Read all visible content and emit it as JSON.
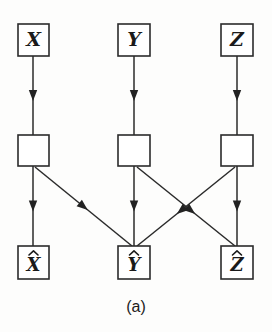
{
  "figure": {
    "caption": "(a)",
    "caption_x": 136,
    "caption_y": 308,
    "background_color": "#fdfdfc",
    "stroke_color": "#2b2b2b",
    "fill_color": "#ffffff",
    "width": 272,
    "height": 332
  },
  "diagram_data": {
    "type": "diagram",
    "description": "Three-layer signal flow graph: source nodes X, Y, Z feed into unlabeled processing blocks, which feed into reconstructed outputs X-hat, Y-hat, Z-hat with cross connections.",
    "columns": [
      {
        "id": "col-x",
        "center_x": 33
      },
      {
        "id": "col-y",
        "center_x": 134
      },
      {
        "id": "col-z",
        "center_x": 237
      }
    ],
    "rows": [
      {
        "id": "row-source",
        "top": 24,
        "label": "source"
      },
      {
        "id": "row-block",
        "top": 135,
        "label": "processing-block"
      },
      {
        "id": "row-output",
        "top": 246,
        "label": "output"
      }
    ],
    "nodes": [
      {
        "id": "node-x",
        "label": "X",
        "hat": false,
        "x": 18,
        "y": 24,
        "w": 31,
        "h": 32,
        "row": "source"
      },
      {
        "id": "node-y",
        "label": "Y",
        "hat": false,
        "x": 118,
        "y": 24,
        "w": 32,
        "h": 32,
        "row": "source"
      },
      {
        "id": "node-z",
        "label": "Z",
        "hat": false,
        "x": 221,
        "y": 24,
        "w": 32,
        "h": 32,
        "row": "source"
      },
      {
        "id": "block-x",
        "label": "",
        "hat": false,
        "x": 18,
        "y": 135,
        "w": 31,
        "h": 31,
        "row": "block"
      },
      {
        "id": "block-y",
        "label": "",
        "hat": false,
        "x": 118,
        "y": 135,
        "w": 32,
        "h": 31,
        "row": "block"
      },
      {
        "id": "block-z",
        "label": "",
        "hat": false,
        "x": 221,
        "y": 135,
        "w": 32,
        "h": 31,
        "row": "block"
      },
      {
        "id": "node-x-hat",
        "label": "X",
        "hat": true,
        "x": 18,
        "y": 246,
        "w": 31,
        "h": 33,
        "row": "output"
      },
      {
        "id": "node-y-hat",
        "label": "Y",
        "hat": true,
        "x": 118,
        "y": 246,
        "w": 32,
        "h": 33,
        "row": "output"
      },
      {
        "id": "node-z-hat",
        "label": "Z",
        "hat": true,
        "x": 221,
        "y": 246,
        "w": 32,
        "h": 33,
        "row": "output"
      }
    ],
    "edges": [
      {
        "id": "edge-x-block",
        "from": "node-x",
        "to": "block-x",
        "x1": 33,
        "y1": 56,
        "x2": 33,
        "y2": 135,
        "head_t": 0.5
      },
      {
        "id": "edge-y-block",
        "from": "node-y",
        "to": "block-y",
        "x1": 134,
        "y1": 56,
        "x2": 134,
        "y2": 135,
        "head_t": 0.5
      },
      {
        "id": "edge-z-block",
        "from": "node-z",
        "to": "block-z",
        "x1": 237,
        "y1": 56,
        "x2": 237,
        "y2": 135,
        "head_t": 0.5
      },
      {
        "id": "edge-blockx-xhat",
        "from": "block-x",
        "to": "node-x-hat",
        "x1": 33,
        "y1": 166,
        "x2": 33,
        "y2": 246,
        "head_t": 0.5
      },
      {
        "id": "edge-blocky-yhat",
        "from": "block-y",
        "to": "node-y-hat",
        "x1": 134,
        "y1": 166,
        "x2": 134,
        "y2": 246,
        "head_t": 0.5
      },
      {
        "id": "edge-blockz-zhat",
        "from": "block-z",
        "to": "node-z-hat",
        "x1": 237,
        "y1": 166,
        "x2": 237,
        "y2": 246,
        "head_t": 0.5
      },
      {
        "id": "edge-blockx-yhat",
        "from": "block-x",
        "to": "node-y-hat",
        "x1": 35,
        "y1": 167,
        "x2": 132,
        "y2": 246,
        "head_t": 0.5
      },
      {
        "id": "edge-blocky-zhat",
        "from": "block-y",
        "to": "node-z-hat",
        "x1": 137,
        "y1": 167,
        "x2": 235,
        "y2": 246,
        "head_t": 0.55
      },
      {
        "id": "edge-blockz-yhat",
        "from": "block-z",
        "to": "node-y-hat",
        "x1": 235,
        "y1": 167,
        "x2": 137,
        "y2": 246,
        "head_t": 0.55
      }
    ]
  }
}
